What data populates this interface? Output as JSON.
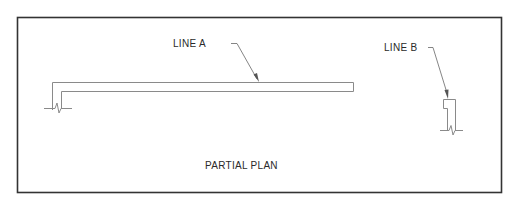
{
  "drawing": {
    "title": "PARTIAL PLAN",
    "labels": {
      "line_a": "LINE A",
      "line_b": "LINE B"
    },
    "colors": {
      "frame": "#333333",
      "linework": "#8a8a8a",
      "leader": "#666666",
      "text": "#2a2a2a",
      "background": "#ffffff"
    }
  }
}
